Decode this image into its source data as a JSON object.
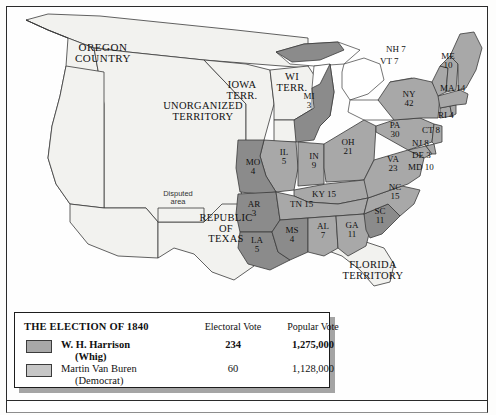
{
  "colors": {
    "whig_fill": "#a8a8a8",
    "democrat_fill": "#8b8b8b",
    "territory_fill": "#f2f2ef",
    "water_fill": "#ffffff",
    "border": "#3a3a3a",
    "page_border": "#2b2b2b"
  },
  "map": {
    "territories": [
      {
        "name": "oregon-country",
        "lines": "OREGON\nCOUNTRY"
      },
      {
        "name": "unorganized-territory",
        "lines": "UNORGANIZED\nTERRITORY"
      },
      {
        "name": "iowa-territory",
        "lines": "IOWA\nTERR."
      },
      {
        "name": "wisconsin-territory",
        "lines": "WI\nTERR."
      },
      {
        "name": "republic-of-texas",
        "lines": "REPUBLIC\nOF\nTEXAS"
      },
      {
        "name": "florida-territory",
        "lines": "FLORIDA\nTERRITORY"
      },
      {
        "name": "disputed-area",
        "lines": "Disputed\narea"
      }
    ],
    "states": [
      {
        "abbr": "ME",
        "votes": "10",
        "party": "whig"
      },
      {
        "abbr": "NH",
        "votes": "7",
        "party": "whig"
      },
      {
        "abbr": "VT",
        "votes": "7",
        "party": "whig"
      },
      {
        "abbr": "MA",
        "votes": "14",
        "party": "whig"
      },
      {
        "abbr": "RI",
        "votes": "4",
        "party": "whig"
      },
      {
        "abbr": "CT",
        "votes": "8",
        "party": "whig"
      },
      {
        "abbr": "NY",
        "votes": "42",
        "party": "whig"
      },
      {
        "abbr": "NJ",
        "votes": "8",
        "party": "whig"
      },
      {
        "abbr": "PA",
        "votes": "30",
        "party": "whig"
      },
      {
        "abbr": "DE",
        "votes": "3",
        "party": "whig"
      },
      {
        "abbr": "MD",
        "votes": "10",
        "party": "whig"
      },
      {
        "abbr": "VA",
        "votes": "23",
        "party": "whig"
      },
      {
        "abbr": "NC",
        "votes": "15",
        "party": "whig"
      },
      {
        "abbr": "SC",
        "votes": "11",
        "party": "democrat"
      },
      {
        "abbr": "GA",
        "votes": "11",
        "party": "whig"
      },
      {
        "abbr": "OH",
        "votes": "21",
        "party": "whig"
      },
      {
        "abbr": "MI",
        "votes": "3",
        "party": "democrat"
      },
      {
        "abbr": "IN",
        "votes": "9",
        "party": "whig"
      },
      {
        "abbr": "IL",
        "votes": "5",
        "party": "whig"
      },
      {
        "abbr": "KY",
        "votes": "15",
        "party": "whig"
      },
      {
        "abbr": "TN",
        "votes": "15",
        "party": "whig"
      },
      {
        "abbr": "MO",
        "votes": "4",
        "party": "democrat"
      },
      {
        "abbr": "AR",
        "votes": "3",
        "party": "democrat"
      },
      {
        "abbr": "MS",
        "votes": "4",
        "party": "democrat"
      },
      {
        "abbr": "AL",
        "votes": "7",
        "party": "whig"
      },
      {
        "abbr": "LA",
        "votes": "5",
        "party": "democrat"
      }
    ],
    "labels": {
      "me": "ME\n10",
      "nh": "NH 7",
      "vt": "VT 7",
      "ma": "MA 14",
      "ri": "RI 4",
      "ct": "CT 8",
      "ny": "NY\n42",
      "nj": "NJ 8",
      "pa": "PA\n30",
      "de": "DE 3",
      "md": "MD 10",
      "va": "VA\n23",
      "nc": "NC\n15",
      "sc": "SC\n11",
      "ga": "GA\n11",
      "oh": "OH\n21",
      "mi": "MI\n3",
      "in": "IN\n9",
      "il": "IL\n5",
      "ky": "KY 15",
      "tn": "TN 15",
      "mo": "MO\n4",
      "ar": "AR\n3",
      "ms": "MS\n4",
      "al": "AL\n7",
      "la": "LA\n5",
      "oregon": "OREGON\nCOUNTRY",
      "unorganized": "UNORGANIZED\nTERRITORY",
      "iowa": "IOWA\nTERR.",
      "wisconsin": "WI\nTERR.",
      "texas": "REPUBLIC\nOF\nTEXAS",
      "florida": "FLORIDA\nTERRITORY",
      "disputed": "Disputed\narea"
    }
  },
  "legend": {
    "title": "THE ELECTION OF 1840",
    "header_electoral": "Electoral Vote",
    "header_popular": "Popular Vote",
    "rows": [
      {
        "name": "W. H. Harrison",
        "party": "(Whig)",
        "electoral": "234",
        "popular": "1,275,000"
      },
      {
        "name": "Martin Van Buren",
        "party": "(Democrat)",
        "electoral": "60",
        "popular": "1,128,000"
      }
    ]
  }
}
